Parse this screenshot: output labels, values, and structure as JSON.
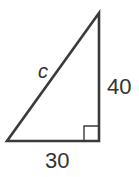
{
  "diagram": {
    "type": "right-triangle",
    "stroke_color": "#3a3a3a",
    "vertices": {
      "top": [
        99,
        13
      ],
      "bottom_left": [
        7,
        141
      ],
      "right_angle": [
        99,
        141
      ]
    },
    "labels": {
      "hypotenuse": "c",
      "vertical_leg": "40",
      "horizontal_leg": "30"
    },
    "right_angle_marker": true
  }
}
